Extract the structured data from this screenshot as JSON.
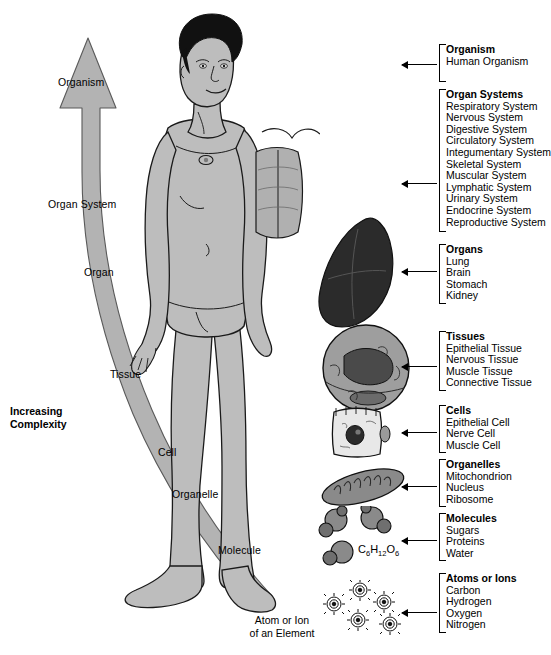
{
  "figure": {
    "axis_label": "Increasing\nComplexity",
    "axis_label_line1": "Increasing",
    "axis_label_line2": "Complexity",
    "tail_caption_line1": "Atom or Ion",
    "tail_caption_line2": "of an Element",
    "glucose_formula": "C6H12O6",
    "arrow_color": "#b3b3b3",
    "arrow_stroke": "#555555",
    "body_fill": "#bdbdbd",
    "body_stroke": "#1a1a1a",
    "organ_fill": "#2b2b2b",
    "text_color": "#000000"
  },
  "arrow_labels": [
    {
      "name": "organism",
      "text": "Organism"
    },
    {
      "name": "organ-system",
      "text": "Organ System"
    },
    {
      "name": "organ",
      "text": "Organ"
    },
    {
      "name": "tissue",
      "text": "Tissue"
    },
    {
      "name": "cell",
      "text": "Cell"
    },
    {
      "name": "organelle",
      "text": "Organelle"
    },
    {
      "name": "molecule",
      "text": "Molecule"
    }
  ],
  "levels": [
    {
      "name": "organism",
      "title": "Organism",
      "items": [
        "Human Organism"
      ]
    },
    {
      "name": "organ-systems",
      "title": "Organ Systems",
      "items": [
        "Respiratory System",
        "Nervous System",
        "Digestive System",
        "Circulatory System",
        "Integumentary System",
        "Skeletal System",
        "Muscular System",
        "Lymphatic System",
        "Urinary System",
        "Endocrine System",
        "Reproductive System"
      ]
    },
    {
      "name": "organs",
      "title": "Organs",
      "items": [
        "Lung",
        "Brain",
        "Stomach",
        "Kidney"
      ]
    },
    {
      "name": "tissues",
      "title": "Tissues",
      "items": [
        "Epithelial Tissue",
        "Nervous Tissue",
        "Muscle Tissue",
        "Connective Tissue"
      ]
    },
    {
      "name": "cells",
      "title": "Cells",
      "items": [
        "Epithelial Cell",
        "Nerve Cell",
        "Muscle Cell"
      ]
    },
    {
      "name": "organelles",
      "title": "Organelles",
      "items": [
        "Mitochondrion",
        "Nucleus",
        "Ribosome"
      ]
    },
    {
      "name": "molecules",
      "title": "Molecules",
      "items": [
        "Sugars",
        "Proteins",
        "Water"
      ]
    },
    {
      "name": "atoms-or-ions",
      "title": "Atoms or Ions",
      "items": [
        "Carbon",
        "Hydrogen",
        "Oxygen",
        "Nitrogen"
      ]
    }
  ],
  "illustrations": [
    {
      "name": "human-body-illustration",
      "label": "human body figure"
    },
    {
      "name": "organ-systems-illustration",
      "label": "respiratory organs overlay"
    },
    {
      "name": "lung-illustration",
      "label": "lung"
    },
    {
      "name": "tissue-micrograph-illustration",
      "label": "tissue cross-section"
    },
    {
      "name": "cell-illustration",
      "label": "epithelial cell"
    },
    {
      "name": "mitochondrion-illustration",
      "label": "mitochondrion"
    },
    {
      "name": "molecules-illustration",
      "label": "molecule spheres"
    },
    {
      "name": "atoms-illustration",
      "label": "atoms"
    }
  ]
}
